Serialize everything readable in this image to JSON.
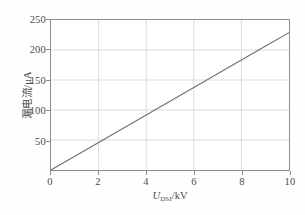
{
  "chart_data": {
    "type": "line",
    "title": "",
    "xlabel": "U_DSI/kV",
    "xlabel_symbol": "U",
    "xlabel_subscript": "DSI",
    "xlabel_unit": "/kV",
    "ylabel": "漏电流/μA",
    "xlim": [
      0,
      10
    ],
    "ylim": [
      0,
      250
    ],
    "xticks": [
      0,
      2,
      4,
      6,
      8,
      10
    ],
    "xtick_labels": [
      "0",
      "2",
      "4",
      "6",
      "8",
      "10"
    ],
    "yticks": [
      50,
      100,
      150,
      200,
      250
    ],
    "ytick_labels": [
      "50",
      "100",
      "150",
      "200",
      "250"
    ],
    "grid": true,
    "legend": "none",
    "series": [
      {
        "name": "leakage current",
        "x": [
          0,
          1,
          2,
          3,
          4,
          5,
          6,
          7,
          8,
          9,
          10
        ],
        "values": [
          0,
          22.9,
          45.8,
          68.7,
          91.6,
          114.5,
          137.4,
          160.3,
          183.2,
          206.1,
          229.0
        ],
        "slope": 22.9,
        "intercept": 0,
        "color": "#6f6f6f"
      }
    ],
    "colors": {
      "line": "#6f6f6f",
      "frame": "#8d8d8d",
      "grid": "#dcdcdc",
      "text": "#4a4a4a",
      "background": "#ffffff"
    }
  }
}
